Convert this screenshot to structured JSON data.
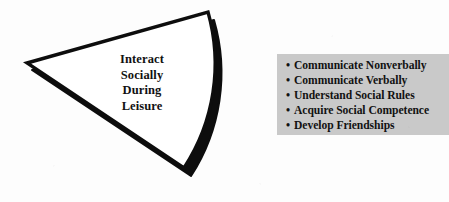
{
  "figure": {
    "name": "interact-socially-during-leisure-diagram",
    "background_color": "#fdfdfd"
  },
  "wedge": {
    "shape": "pie-wedge",
    "fill_color": "#ffffff",
    "outline_color": "#0d0d0d",
    "shadow_color": "#0d0d0d",
    "label_lines": [
      "Interact",
      "Socially",
      "During",
      "Leisure"
    ],
    "label_text": "Interact Socially During Leisure",
    "label_color": "#111111"
  },
  "outcomes": {
    "panel_color": "#c9c9c9",
    "text_color": "#121212",
    "bullet_glyph": "•",
    "items": [
      {
        "label": "Communicate Nonverbally"
      },
      {
        "label": "Communicate Verbally"
      },
      {
        "label": "Understand Social Rules"
      },
      {
        "label": "Acquire Social Competence"
      },
      {
        "label": "Develop Friendships"
      }
    ]
  }
}
